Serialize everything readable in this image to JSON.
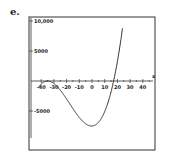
{
  "figure_label": "e.",
  "chart_data": {
    "type": "line",
    "title": "",
    "xlabel": "x",
    "ylabel": "",
    "xlim": [
      -50,
      50
    ],
    "ylim": [
      -11500,
      10500
    ],
    "x_ticks": [
      -40,
      -30,
      -20,
      -10,
      0,
      10,
      20,
      30,
      40
    ],
    "x_tick_labels": [
      "-40",
      "-30",
      "-20",
      "-10",
      "0",
      "10",
      "20",
      "30",
      "40"
    ],
    "y_ticks": [
      10000,
      5000,
      -5000
    ],
    "y_tick_labels": [
      "10,000",
      "5000",
      "-5000"
    ],
    "grid": false,
    "legend": null,
    "series": [
      {
        "name": "f(x)",
        "description": "cubic with double root near x=-35 and root near x=17; local min about -7500 near x=2",
        "x": [
          -41,
          -38,
          -35,
          -30,
          -25,
          -20,
          -15,
          -10,
          -5,
          0,
          2,
          5,
          10,
          15,
          17,
          20,
          23
        ],
        "y": [
          -11500,
          -3600,
          0,
          -2100,
          -4500,
          -6100,
          -7000,
          -7500,
          -7600,
          -7500,
          -7450,
          -7000,
          -5000,
          -1800,
          0,
          3300,
          10500
        ]
      }
    ]
  }
}
